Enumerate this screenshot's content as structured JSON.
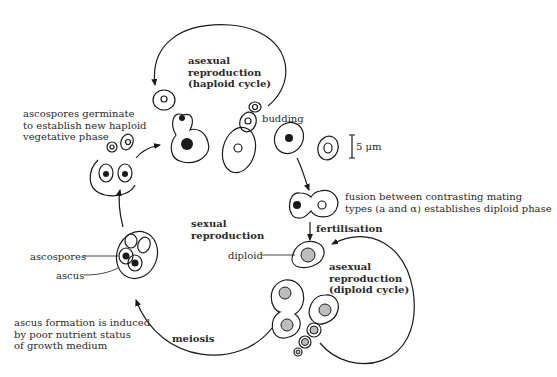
{
  "diagram": {
    "colors": {
      "line": "#1a1a1a",
      "text": "#2a2a2a",
      "diploid_nucleus": "#bdbdbd",
      "background": "#ffffff"
    },
    "labels": {
      "asexual_haploid": [
        "asexual",
        "reproduction",
        "(haploid cycle)"
      ],
      "ascospores_germinate": [
        "ascospores germinate",
        "to establish new haploid",
        "vegetative phase"
      ],
      "budding": "budding",
      "scale_bar": "5 μm",
      "fusion": [
        "fusion between contrasting mating",
        "types (a and α) establishes diploid phase"
      ],
      "fertilisation": "fertilisation",
      "sexual_reproduction": [
        "sexual",
        "reproduction"
      ],
      "diploid": "diploid",
      "asexual_diploid": [
        "asexual",
        "reproduction",
        "(diploid cycle)"
      ],
      "ascospores": "ascospores",
      "ascus": "ascus",
      "ascus_formation": [
        "ascus formation is induced",
        "by poor nutrient status",
        "of growth medium"
      ],
      "meiosis": "meiosis"
    }
  }
}
